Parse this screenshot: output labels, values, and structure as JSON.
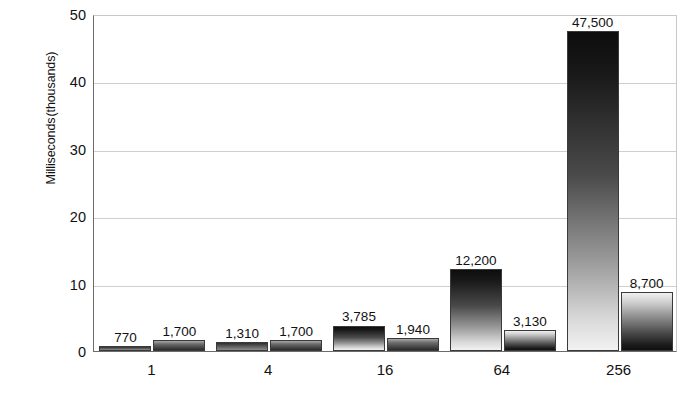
{
  "chart_data": {
    "type": "bar",
    "title": "",
    "subtitle": "",
    "xlabel": "",
    "ylabel": "Milliseconds (thousands)",
    "ylabel_lines": [
      "Milliseconds",
      "(thousands)"
    ],
    "categories": [
      "1",
      "4",
      "16",
      "64",
      "256"
    ],
    "series": [
      {
        "name": "Series 1",
        "values": [
          770,
          1310,
          3785,
          12200,
          47500
        ],
        "labels": [
          "770",
          "1,310",
          "3,785",
          "12,200",
          "47,500"
        ],
        "gradient": "dark-top-to-light-bottom"
      },
      {
        "name": "Series 2",
        "values": [
          1700,
          1700,
          1940,
          3130,
          8700
        ],
        "labels": [
          "1,700",
          "1,700",
          "1,940",
          "3,130",
          "8,700"
        ],
        "gradient": "light-top-to-dark-bottom"
      }
    ],
    "ylim": [
      0,
      50000
    ],
    "y_tick_values": [
      0,
      10000,
      20000,
      30000,
      40000,
      50000
    ],
    "y_tick_labels": [
      "0",
      "10",
      "20",
      "30",
      "40",
      "50"
    ],
    "y_unit_scale": 1000,
    "grid": true,
    "grid_axis": "y",
    "legend": "none",
    "legend_position": "none",
    "annotations": "data labels shown above every bar",
    "colors": {
      "background": "#ffffff",
      "gridline": "#cfcfcf",
      "axis": "#6b6b6b",
      "text": "#111111",
      "series1_dark": "#0d0d0d",
      "series1_light": "#f2f2f2",
      "series2_dark": "#0f0f0f",
      "series2_light": "#f0f0f0"
    }
  }
}
